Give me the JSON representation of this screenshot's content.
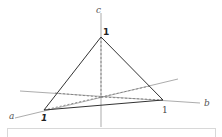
{
  "diagram": {
    "axes": {
      "a": {
        "label": "a"
      },
      "b": {
        "label": "b"
      },
      "c": {
        "label": "c"
      }
    },
    "vertices": {
      "apex": {
        "label": "1"
      },
      "left": {
        "label": "1"
      },
      "right": {
        "label": "1"
      }
    },
    "colors": {
      "solid_line": "#333333",
      "axis_line": "#888888",
      "dashed_line": "#777777",
      "text": "#222222",
      "box_border": "#d8d8d8"
    }
  }
}
